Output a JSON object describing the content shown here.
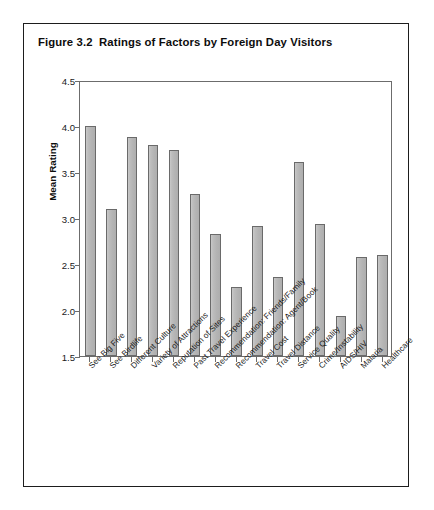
{
  "figure": {
    "title": "Figure 3.2  Ratings of Factors by Foreign Day Visitors"
  },
  "chart_data": {
    "type": "bar",
    "title": "Figure 3.2  Ratings of Factors by Foreign Day Visitors",
    "xlabel": "",
    "ylabel": "Mean Rating",
    "ylim": [
      1.5,
      4.5
    ],
    "ytick_step": 0.5,
    "ytick_labels": [
      "4.5",
      "4.0",
      "3.5",
      "3.0",
      "2.5",
      "2.0",
      "1.5"
    ],
    "ytick_values": [
      4.5,
      4.0,
      3.5,
      3.0,
      2.5,
      2.0,
      1.5
    ],
    "grid": false,
    "legend": null,
    "bar_fill_color": "#b8b8b8",
    "bar_edge_color": "#6a6a6a",
    "categories": [
      "See Big Five",
      "See Birdlife",
      "Different Culture",
      "Variety of Attractions",
      "Reputation of Sites",
      "Past Travel Experience",
      "Recommendation: Friends/Family",
      "Recommendation: Agent/Book",
      "Travel Cost",
      "Travel Distance",
      "Service Quality",
      "Crime/Instability",
      "AIDS/HIV",
      "Malaria",
      "Healthcare"
    ],
    "values": [
      4.0,
      3.1,
      3.88,
      3.79,
      3.74,
      3.26,
      2.83,
      2.25,
      2.91,
      2.36,
      3.61,
      2.93,
      1.94,
      2.58,
      2.6
    ]
  }
}
